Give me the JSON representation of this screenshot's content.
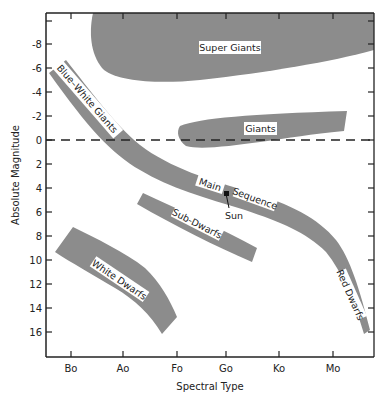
{
  "diagram": {
    "x_axis": {
      "label": "Spectral Type",
      "ticks": [
        "Bo",
        "Ao",
        "Fo",
        "Go",
        "Ko",
        "Mo"
      ]
    },
    "y_axis": {
      "label": "Absolute Magnitude",
      "ticks": [
        "-8",
        "-6",
        "-4",
        "-2",
        "0",
        "2",
        "4",
        "6",
        "8",
        "10",
        "12",
        "14",
        "16"
      ]
    },
    "regions": {
      "super_giants": "Super Giants",
      "giants": "Giants",
      "blue_white_giants": "Blue–White Giants",
      "main": "Main",
      "sequence": "Sequence",
      "sub_dwarfs": "Sub-Dwarfs",
      "white_dwarfs": "White Dwarfs",
      "red_dwarfs": "Red Dwarfs"
    },
    "markers": {
      "sun": "Sun"
    },
    "reference_line": "absolute magnitude 0 (dashed)",
    "colors": {
      "region_fill": "#8c8c8c",
      "axis": "#222222"
    }
  }
}
